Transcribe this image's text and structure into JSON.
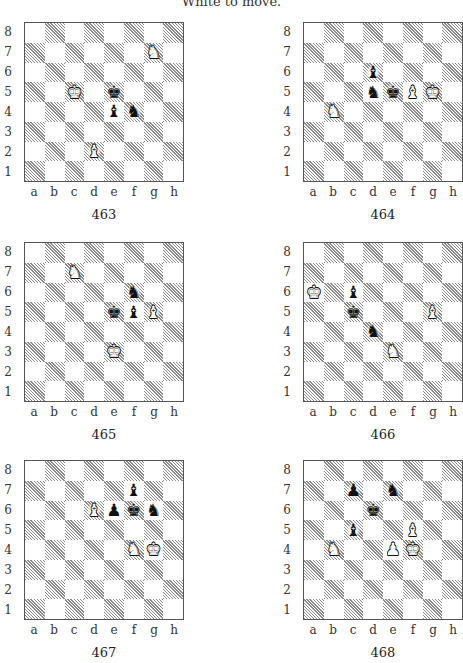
{
  "header": {
    "text": "White to move."
  },
  "files": [
    "a",
    "b",
    "c",
    "d",
    "e",
    "f",
    "g",
    "h"
  ],
  "ranks": [
    "8",
    "7",
    "6",
    "5",
    "4",
    "3",
    "2",
    "1"
  ],
  "diagrams": [
    {
      "number": "463",
      "position": {
        "left": 0,
        "top": 22
      },
      "pieces": [
        {
          "square": "g7",
          "color": "white",
          "type": "knight"
        },
        {
          "square": "c5",
          "color": "white",
          "type": "king"
        },
        {
          "square": "d2",
          "color": "white",
          "type": "bishop"
        },
        {
          "square": "e5",
          "color": "black",
          "type": "king"
        },
        {
          "square": "e4",
          "color": "black",
          "type": "bishop"
        },
        {
          "square": "f4",
          "color": "black",
          "type": "knight"
        }
      ]
    },
    {
      "number": "464",
      "position": {
        "left": 279,
        "top": 22
      },
      "pieces": [
        {
          "square": "d6",
          "color": "black",
          "type": "bishop"
        },
        {
          "square": "d5",
          "color": "black",
          "type": "knight"
        },
        {
          "square": "e5",
          "color": "black",
          "type": "king"
        },
        {
          "square": "f5",
          "color": "white",
          "type": "bishop"
        },
        {
          "square": "g5",
          "color": "white",
          "type": "king"
        },
        {
          "square": "b4",
          "color": "white",
          "type": "knight"
        }
      ]
    },
    {
      "number": "465",
      "position": {
        "left": 0,
        "top": 242
      },
      "pieces": [
        {
          "square": "c7",
          "color": "white",
          "type": "knight"
        },
        {
          "square": "f6",
          "color": "black",
          "type": "knight"
        },
        {
          "square": "e5",
          "color": "black",
          "type": "king"
        },
        {
          "square": "f5",
          "color": "black",
          "type": "bishop"
        },
        {
          "square": "g5",
          "color": "white",
          "type": "bishop"
        },
        {
          "square": "e3",
          "color": "white",
          "type": "king"
        }
      ]
    },
    {
      "number": "466",
      "position": {
        "left": 279,
        "top": 242
      },
      "pieces": [
        {
          "square": "a6",
          "color": "white",
          "type": "king"
        },
        {
          "square": "c6",
          "color": "black",
          "type": "bishop"
        },
        {
          "square": "c5",
          "color": "black",
          "type": "king"
        },
        {
          "square": "g5",
          "color": "white",
          "type": "bishop"
        },
        {
          "square": "d4",
          "color": "black",
          "type": "knight"
        },
        {
          "square": "e3",
          "color": "white",
          "type": "knight"
        }
      ]
    },
    {
      "number": "467",
      "position": {
        "left": 0,
        "top": 460
      },
      "pieces": [
        {
          "square": "f7",
          "color": "black",
          "type": "bishop"
        },
        {
          "square": "d6",
          "color": "white",
          "type": "bishop"
        },
        {
          "square": "e6",
          "color": "black",
          "type": "pawn"
        },
        {
          "square": "f6",
          "color": "black",
          "type": "king"
        },
        {
          "square": "g6",
          "color": "black",
          "type": "knight"
        },
        {
          "square": "f4",
          "color": "white",
          "type": "knight"
        },
        {
          "square": "g4",
          "color": "white",
          "type": "king"
        }
      ]
    },
    {
      "number": "468",
      "position": {
        "left": 279,
        "top": 460
      },
      "pieces": [
        {
          "square": "c7",
          "color": "black",
          "type": "pawn"
        },
        {
          "square": "e7",
          "color": "black",
          "type": "knight"
        },
        {
          "square": "d6",
          "color": "black",
          "type": "king"
        },
        {
          "square": "c5",
          "color": "black",
          "type": "bishop"
        },
        {
          "square": "f5",
          "color": "white",
          "type": "bishop"
        },
        {
          "square": "b4",
          "color": "white",
          "type": "knight"
        },
        {
          "square": "e4",
          "color": "white",
          "type": "pawn"
        },
        {
          "square": "f4",
          "color": "white",
          "type": "king"
        }
      ]
    }
  ],
  "piece_glyphs": {
    "king": "♚",
    "queen": "♛",
    "rook": "♜",
    "bishop": "♝",
    "knight": "♞",
    "pawn": "♟"
  },
  "colors": {
    "hatch": "#8a8a8a",
    "border": "#555555",
    "text": "#333333"
  }
}
